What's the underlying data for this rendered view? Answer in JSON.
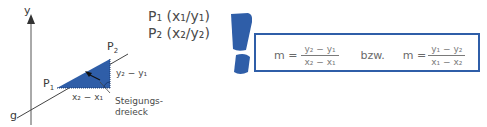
{
  "diagram": {
    "axis_label_y": "y",
    "line_label": "g",
    "point1_label": "P",
    "point1_sub": "1",
    "point2_label": "P",
    "point2_sub": "2",
    "dy_label": "y₂ − y₁",
    "dx_label": "x₂ − x₁",
    "triangle_label_line1": "Steigungs-",
    "triangle_label_line2": "dreieck",
    "triangle_color": "#2f5ea8"
  },
  "points": {
    "p1": "P₁ (x₁/y₁)",
    "p2": "P₂ (x₂/y₂)"
  },
  "formula": {
    "m1_lhs": "m =",
    "m1_num": "y₂ − y₁",
    "m1_den": "x₂ − x₁",
    "connector": "bzw.",
    "m2_lhs": "m =",
    "m2_num": "y₁ − y₂",
    "m2_den": "x₁ − x₂",
    "border_color": "#2f5ea8"
  },
  "icon": {
    "name": "exclamation-mark-icon",
    "color": "#2f5ea8"
  }
}
